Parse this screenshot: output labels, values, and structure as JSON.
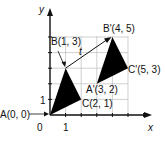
{
  "diagram": {
    "type": "coordinate-plane-translation",
    "axes": {
      "x_label": "x",
      "y_label": "y",
      "origin_label": "0",
      "x_tick_label": "1",
      "y_tick_label": "1"
    },
    "vector_label": "t",
    "points": {
      "A": "A(0, 0)",
      "B": "B(1, 3)",
      "C": "C(2, 1)",
      "A_prime": "A'(3, 2)",
      "B_prime": "B'(4, 5)",
      "C_prime": "C'(5, 3)"
    },
    "original_triangle": [
      [
        0,
        0
      ],
      [
        1,
        3
      ],
      [
        2,
        1
      ]
    ],
    "image_triangle": [
      [
        3,
        2
      ],
      [
        4,
        5
      ],
      [
        5,
        3
      ]
    ],
    "translation_vector": [
      3,
      2
    ],
    "colors": {
      "fill": "#000000",
      "grid": "#bbbbbb",
      "axis": "#111111"
    }
  }
}
